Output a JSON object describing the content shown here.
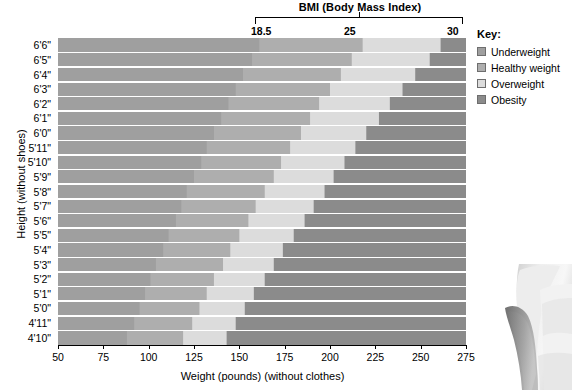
{
  "header": {
    "bmi_title": "BMI (Body Mass Index)",
    "bmi_ticks": [
      "18.5",
      "25",
      "30"
    ]
  },
  "axes": {
    "y_title": "Height (without shoes)",
    "x_title": "Weight (pounds) (without clothes)",
    "y_labels": [
      "6'6\"",
      "6'5\"",
      "6'4\"",
      "6'3\"",
      "6'2\"",
      "6'1\"",
      "6'0\"",
      "5'11\"",
      "5'10\"",
      "5'9\"",
      "5'8\"",
      "5'7\"",
      "5'6\"",
      "5'5\"",
      "5'4\"",
      "5'3\"",
      "5'2\"",
      "5'1\"",
      "5'0\"",
      "4'11\"",
      "4'10\""
    ],
    "x_labels": [
      "50",
      "75",
      "100",
      "125",
      "150",
      "175",
      "200",
      "225",
      "250",
      "275"
    ]
  },
  "legend": {
    "title": "Key:",
    "items": [
      {
        "label": "Underweight",
        "color": "#9f9f9f"
      },
      {
        "label": "Healthy weight",
        "color": "#aeaeae"
      },
      {
        "label": "Overweight",
        "color": "#dcdcdc"
      },
      {
        "label": "Obesity",
        "color": "#8b8b8b"
      }
    ]
  },
  "chart_data": {
    "type": "heatmap",
    "title": "BMI (Body Mass Index)",
    "xlabel": "Weight (pounds) (without clothes)",
    "ylabel": "Height (without shoes)",
    "xlim": [
      50,
      275
    ],
    "ylim_inches": [
      58,
      78
    ],
    "grid": true,
    "legend_position": "right",
    "bmi_thresholds": [
      18.5,
      25,
      30
    ],
    "categories": [
      "Underweight",
      "Healthy weight",
      "Overweight",
      "Obesity"
    ],
    "band_colors": [
      "#9f9f9f",
      "#aeaeae",
      "#dcdcdc",
      "#8b8b8b"
    ],
    "boundary_lines_lbs": {
      "underweight_healthy": {
        "at_4ft10in": 88,
        "at_6ft6in": 161
      },
      "healthy_overweight": {
        "at_4ft10in": 119,
        "at_6ft6in": 218
      },
      "overweight_obesity": {
        "at_4ft10in": 143,
        "at_6ft6in": 261
      }
    },
    "rows": [
      {
        "height": "6'6\"",
        "underweight_max": 161,
        "healthy_max": 218,
        "overweight_max": 261
      },
      {
        "height": "6'5\"",
        "underweight_max": 157,
        "healthy_max": 212,
        "overweight_max": 255
      },
      {
        "height": "6'4\"",
        "underweight_max": 152,
        "healthy_max": 206,
        "overweight_max": 247
      },
      {
        "height": "6'3\"",
        "underweight_max": 148,
        "healthy_max": 200,
        "overweight_max": 240
      },
      {
        "height": "6'2\"",
        "underweight_max": 144,
        "healthy_max": 194,
        "overweight_max": 233
      },
      {
        "height": "6'1\"",
        "underweight_max": 140,
        "healthy_max": 189,
        "overweight_max": 227
      },
      {
        "height": "6'0\"",
        "underweight_max": 136,
        "healthy_max": 184,
        "overweight_max": 220
      },
      {
        "height": "5'11\"",
        "underweight_max": 132,
        "healthy_max": 178,
        "overweight_max": 214
      },
      {
        "height": "5'10\"",
        "underweight_max": 129,
        "healthy_max": 173,
        "overweight_max": 208
      },
      {
        "height": "5'9\"",
        "underweight_max": 125,
        "healthy_max": 169,
        "overweight_max": 202
      },
      {
        "height": "5'8\"",
        "underweight_max": 121,
        "healthy_max": 164,
        "overweight_max": 197
      },
      {
        "height": "5'7\"",
        "underweight_max": 118,
        "healthy_max": 159,
        "overweight_max": 191
      },
      {
        "height": "5'6\"",
        "underweight_max": 115,
        "healthy_max": 155,
        "overweight_max": 186
      },
      {
        "height": "5'5\"",
        "underweight_max": 111,
        "healthy_max": 150,
        "overweight_max": 180
      },
      {
        "height": "5'4\"",
        "underweight_max": 108,
        "healthy_max": 145,
        "overweight_max": 174
      },
      {
        "height": "5'3\"",
        "underweight_max": 104,
        "healthy_max": 141,
        "overweight_max": 169
      },
      {
        "height": "5'2\"",
        "underweight_max": 101,
        "healthy_max": 136,
        "overweight_max": 164
      },
      {
        "height": "5'1\"",
        "underweight_max": 98,
        "healthy_max": 132,
        "overweight_max": 158
      },
      {
        "height": "5'0\"",
        "underweight_max": 95,
        "healthy_max": 128,
        "overweight_max": 153
      },
      {
        "height": "4'11\"",
        "underweight_max": 92,
        "healthy_max": 124,
        "overweight_max": 148
      },
      {
        "height": "4'10\"",
        "underweight_max": 88,
        "healthy_max": 119,
        "overweight_max": 143
      }
    ]
  }
}
